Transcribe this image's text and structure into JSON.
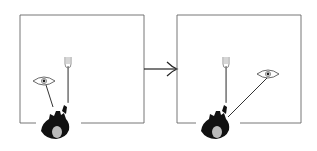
{
  "diagram": {
    "type": "before-after gaze illustration",
    "panels": [
      {
        "id": "left",
        "box": {
          "x": 20,
          "y": 15,
          "w": 124,
          "h": 108
        },
        "fork": {
          "x": 68,
          "y": 58
        },
        "eye": {
          "x": 44,
          "y": 81
        },
        "person": {
          "x": 59,
          "y": 128
        },
        "gaze_line": {
          "x1": 45,
          "y1": 86,
          "x2": 53,
          "y2": 107
        }
      },
      {
        "id": "right",
        "box": {
          "x": 177,
          "y": 15,
          "w": 124,
          "h": 108
        },
        "fork": {
          "x": 226,
          "y": 58
        },
        "eye": {
          "x": 268,
          "y": 74
        },
        "person": {
          "x": 218,
          "y": 128
        },
        "gaze_line": {
          "x1": 268,
          "y1": 77,
          "x2": 228,
          "y2": 118
        }
      }
    ],
    "arrow": {
      "x1": 144,
      "y1": 69,
      "x2": 177,
      "y2": 69,
      "direction": "right"
    },
    "colors": {
      "line": "#555555",
      "figure": "#111111",
      "background": "#ffffff"
    }
  }
}
